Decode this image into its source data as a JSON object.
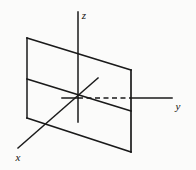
{
  "figure": {
    "background_color": "#fbfbfa",
    "stroke_color": "#1a1a1a",
    "axes": {
      "x": {
        "label": "x",
        "label_x": 18,
        "label_y": 161
      },
      "y": {
        "label": "y",
        "label_x": 178,
        "label_y": 110
      },
      "z": {
        "label": "z",
        "label_x": 84,
        "label_y": 19
      }
    },
    "geometry": {
      "origin": {
        "x": 78,
        "y": 98
      },
      "z_axis": {
        "x1": 78,
        "y1": 12,
        "x2": 78,
        "y2": 122
      },
      "y_axis_solid_left": {
        "x1": 62,
        "y1": 98,
        "x2": 78,
        "y2": 98
      },
      "y_axis_dashed": {
        "x1": 78,
        "y1": 98,
        "x2": 131,
        "y2": 98
      },
      "y_axis_solid_right": {
        "x1": 131,
        "y1": 98,
        "x2": 172,
        "y2": 98
      },
      "x_axis": {
        "x1": 18,
        "y1": 148,
        "x2": 98,
        "y2": 78
      },
      "plane_corners": [
        {
          "x": 27,
          "y": 38
        },
        {
          "x": 131,
          "y": 70
        },
        {
          "x": 131,
          "y": 152
        },
        {
          "x": 27,
          "y": 118
        }
      ],
      "plane_midline": {
        "x1": 27,
        "y1": 79,
        "x2": 131,
        "y2": 111
      }
    }
  }
}
